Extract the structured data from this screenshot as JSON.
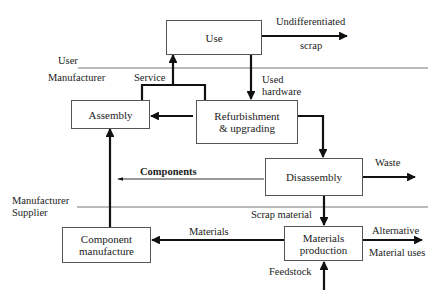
{
  "zones": {
    "user": "User",
    "manufacturer_top": "Manufacturer",
    "manufacturer_bottom": "Manufacturer",
    "supplier": "Supplier"
  },
  "nodes": {
    "use": "Use",
    "assembly": "Assembly",
    "refurbishment_line1": "Refurbishment",
    "refurbishment_line2": "& upgrading",
    "disassembly": "Disassembly",
    "component_manufacture_line1": "Component",
    "component_manufacture_line2": "manufacture",
    "materials_production_line1": "Materials",
    "materials_production_line2": "production"
  },
  "flows": {
    "undifferentiated": "Undifferentiated",
    "scrap": "scrap",
    "service": "Service",
    "used": "Used",
    "hardware": "hardware",
    "waste": "Waste",
    "components": "Components",
    "scrap_material": "Scrap material",
    "materials": "Materials",
    "alternative": "Alternative",
    "material_uses": "Material uses",
    "feedstock": "Feedstock"
  }
}
